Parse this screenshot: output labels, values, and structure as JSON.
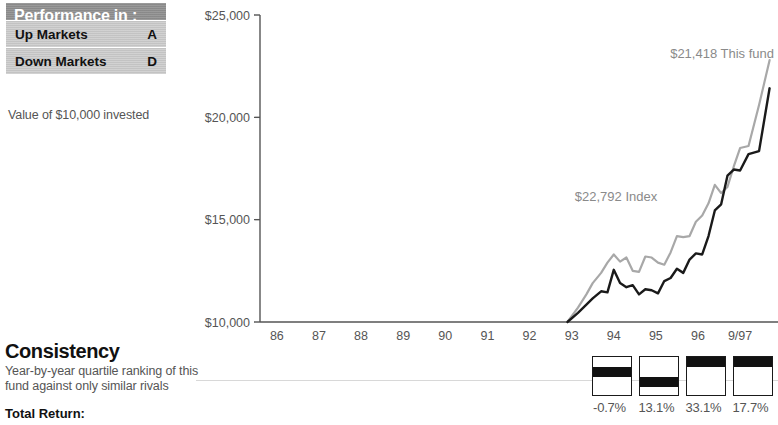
{
  "performance": {
    "header": "Performance in :",
    "rows": [
      {
        "label": "Up Markets",
        "grade": "A"
      },
      {
        "label": "Down Markets",
        "grade": "D"
      }
    ],
    "caption": "Value of $10,000 invested"
  },
  "consistency": {
    "title": "Consistency",
    "description": "Year-by-year quartile ranking of this fund against only similar rivals",
    "total_return_label": "Total Return:",
    "quartiles": [
      {
        "rank": 2,
        "value": "-0.7%"
      },
      {
        "rank": 3,
        "value": "13.1%"
      },
      {
        "rank": 1,
        "value": "33.1%"
      },
      {
        "rank": 1,
        "value": "17.7%"
      }
    ]
  },
  "chart_data": {
    "type": "line",
    "title": "",
    "xlabel": "",
    "ylabel": "",
    "ylim": [
      10000,
      25000
    ],
    "yticks": [
      25000,
      20000,
      15000,
      10000
    ],
    "ytick_labels": [
      "$25,000",
      "$20,000",
      "$15,000",
      "$10,000"
    ],
    "categories": [
      "86",
      "87",
      "88",
      "89",
      "90",
      "91",
      "92",
      "93",
      "94",
      "95",
      "96",
      "9/97"
    ],
    "grid": false,
    "legend": "annotations",
    "annotations": [
      {
        "text": "$21,418 This fund",
        "series": "This fund",
        "value": 21418
      },
      {
        "text": "$22,792 Index",
        "series": "Index",
        "value": 22792
      }
    ],
    "series": [
      {
        "name": "This fund",
        "color": "#1a1a1a",
        "x": [
          92.9,
          93.15,
          93.35,
          93.5,
          93.7,
          93.85,
          94.0,
          94.15,
          94.3,
          94.45,
          94.6,
          94.75,
          94.9,
          95.05,
          95.2,
          95.35,
          95.5,
          95.65,
          95.8,
          95.95,
          96.1,
          96.25,
          96.4,
          96.55,
          96.7,
          96.85,
          97.0,
          97.2,
          97.45,
          97.7
        ],
        "values": [
          10000,
          10450,
          10850,
          11150,
          11500,
          11450,
          12550,
          11900,
          11700,
          11800,
          11350,
          11600,
          11550,
          11400,
          12000,
          12150,
          12600,
          12400,
          13050,
          13350,
          13300,
          14200,
          15450,
          15750,
          17150,
          17450,
          17400,
          18200,
          18350,
          21418
        ]
      },
      {
        "name": "Index",
        "color": "#a8a8a8",
        "x": [
          92.9,
          93.15,
          93.35,
          93.5,
          93.7,
          93.85,
          94.0,
          94.15,
          94.3,
          94.45,
          94.6,
          94.75,
          94.9,
          95.05,
          95.2,
          95.35,
          95.5,
          95.65,
          95.8,
          95.95,
          96.1,
          96.25,
          96.4,
          96.55,
          96.7,
          96.85,
          97.0,
          97.2,
          97.45,
          97.7
        ],
        "values": [
          10000,
          10700,
          11350,
          11900,
          12400,
          12900,
          13300,
          12950,
          13150,
          12500,
          12450,
          13200,
          13150,
          12900,
          12800,
          13400,
          14200,
          14150,
          14200,
          14900,
          15200,
          15800,
          16700,
          16300,
          16600,
          17600,
          18500,
          18600,
          20600,
          22792
        ]
      }
    ]
  }
}
